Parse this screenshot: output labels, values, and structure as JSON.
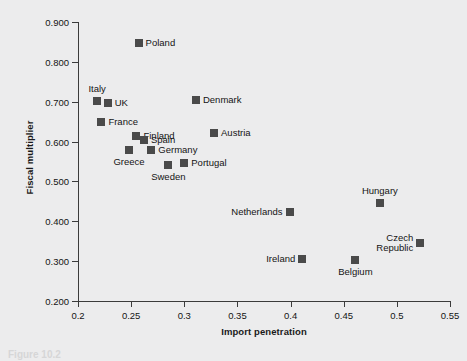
{
  "chart_data": {
    "type": "scatter",
    "title": "",
    "xlabel": "Import penetration",
    "ylabel": "Fiscal multiplier",
    "xlim": [
      0.2,
      0.55
    ],
    "ylim": [
      0.2,
      0.9
    ],
    "xticks": [
      "0.2",
      "0.25",
      "0.3",
      "0.35",
      "0.4",
      "0.45",
      "0.5",
      "0.55"
    ],
    "xtick_values": [
      0.2,
      0.25,
      0.3,
      0.35,
      0.4,
      0.45,
      0.5,
      0.55
    ],
    "yticks": [
      "0.200",
      "0.300",
      "0.400",
      "0.500",
      "0.600",
      "0.700",
      "0.800",
      "0.900"
    ],
    "ytick_values": [
      0.2,
      0.3,
      0.4,
      0.5,
      0.6,
      0.7,
      0.8,
      0.9
    ],
    "grid": false,
    "legend": "none",
    "marker_color": "#4a4a4a",
    "marker_shape": "square",
    "points": [
      {
        "label": "Poland",
        "x": 0.257,
        "y": 0.848,
        "label_pos": "right"
      },
      {
        "label": "Italy",
        "x": 0.218,
        "y": 0.703,
        "label_pos": "top"
      },
      {
        "label": "UK",
        "x": 0.228,
        "y": 0.698,
        "label_pos": "right"
      },
      {
        "label": "France",
        "x": 0.222,
        "y": 0.648,
        "label_pos": "right"
      },
      {
        "label": "Denmark",
        "x": 0.311,
        "y": 0.704,
        "label_pos": "right"
      },
      {
        "label": "Finland",
        "x": 0.255,
        "y": 0.615,
        "label_pos": "right"
      },
      {
        "label": "Spain",
        "x": 0.262,
        "y": 0.605,
        "label_pos": "right"
      },
      {
        "label": "Austria",
        "x": 0.328,
        "y": 0.622,
        "label_pos": "right"
      },
      {
        "label": "Greece",
        "x": 0.248,
        "y": 0.58,
        "label_pos": "bottom"
      },
      {
        "label": "Germany",
        "x": 0.269,
        "y": 0.578,
        "label_pos": "right"
      },
      {
        "label": "Sweden",
        "x": 0.285,
        "y": 0.541,
        "label_pos": "bottom"
      },
      {
        "label": "Portugal",
        "x": 0.3,
        "y": 0.545,
        "label_pos": "right"
      },
      {
        "label": "Netherlands",
        "x": 0.399,
        "y": 0.423,
        "label_pos": "left"
      },
      {
        "label": "Hungary",
        "x": 0.484,
        "y": 0.447,
        "label_pos": "top"
      },
      {
        "label": "Czech Republic",
        "x": 0.522,
        "y": 0.346,
        "label_pos": "left"
      },
      {
        "label": "Ireland",
        "x": 0.411,
        "y": 0.306,
        "label_pos": "left"
      },
      {
        "label": "Belgium",
        "x": 0.461,
        "y": 0.304,
        "label_pos": "bottom"
      }
    ]
  },
  "caption": "Figure 10.2"
}
